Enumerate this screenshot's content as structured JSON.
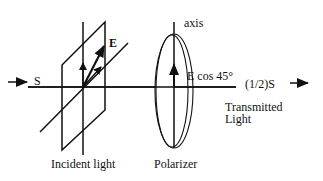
{
  "diagram": {
    "colors": {
      "ink": "#111111",
      "background": "#ffffff"
    },
    "labels": {
      "incident_intensity": "S",
      "field_vector": "E",
      "polarizer_axis": "axis",
      "transmitted_field": "E cos 45°",
      "transmitted_intensity": "(1/2)S",
      "transmitted_line1": "Transmitted",
      "transmitted_line2": "Light",
      "incident_caption": "Incident light",
      "polarizer_caption": "Polarizer"
    },
    "components": [
      {
        "id": "incident-light",
        "label": "Incident light",
        "shape": "parallelogram-plane-with-E-vectors"
      },
      {
        "id": "polarizer",
        "label": "Polarizer",
        "shape": "ellipse-disk-with-vertical-axis"
      }
    ],
    "edges": [
      {
        "from": "source",
        "to": "incident-light",
        "label": "S"
      },
      {
        "from": "incident-light",
        "to": "polarizer",
        "label": ""
      },
      {
        "from": "polarizer",
        "to": "output",
        "label": "(1/2)S"
      }
    ]
  }
}
